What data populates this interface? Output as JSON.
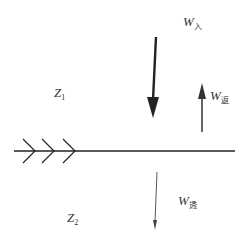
{
  "diagram": {
    "type": "wave-reflection-transmission",
    "interface": {
      "style": "horizontal line with chevrons indicating boundary",
      "chevron_count": 3
    },
    "media": [
      {
        "label_main": "Z",
        "label_sub": "1",
        "region": "upper"
      },
      {
        "label_main": "Z",
        "label_sub": "2",
        "region": "lower"
      }
    ],
    "arrows": [
      {
        "name": "incident",
        "label_main": "W",
        "label_sub": "入",
        "direction": "down",
        "weight": "bold"
      },
      {
        "name": "reflected",
        "label_main": "W",
        "label_sub": "返",
        "direction": "up",
        "weight": "medium"
      },
      {
        "name": "transmitted",
        "label_main": "W",
        "label_sub": "透",
        "direction": "down",
        "weight": "thin"
      }
    ],
    "colors": {
      "line": "#222222",
      "text": "#333333",
      "background": "#ffffff"
    }
  }
}
